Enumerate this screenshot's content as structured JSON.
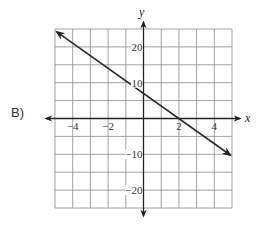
{
  "option_label": "B)",
  "chart_data": {
    "type": "line",
    "title": "",
    "xlabel": "x",
    "ylabel": "y",
    "xlim": [
      -5,
      5
    ],
    "ylim": [
      -25,
      25
    ],
    "x_grid_step": 1,
    "y_grid_step": 5,
    "grid": true,
    "x_tick_labels": [
      {
        "value": -4,
        "text": "−4"
      },
      {
        "value": -2,
        "text": "−2"
      },
      {
        "value": 2,
        "text": "2"
      },
      {
        "value": 4,
        "text": "4"
      }
    ],
    "y_tick_labels": [
      {
        "value": 20,
        "text": "20"
      },
      {
        "value": 10,
        "text": "10"
      },
      {
        "value": -10,
        "text": "−10"
      },
      {
        "value": -20,
        "text": "−20"
      }
    ],
    "series": [
      {
        "name": "line",
        "equation": "y = -3.5x + 7",
        "x": [
          -4.9,
          4.9
        ],
        "y": [
          24.2,
          -10.2
        ],
        "arrows": "both",
        "x_intercept": 2,
        "y_intercept": 7
      }
    ]
  },
  "colors": {
    "grid": "#8a8a8a",
    "axis": "#222222",
    "line": "#2a2a2a",
    "text": "#333333"
  }
}
